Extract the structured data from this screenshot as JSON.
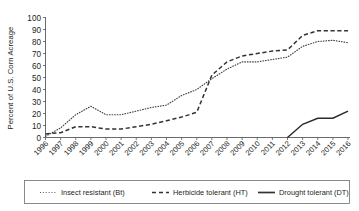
{
  "chart_data": {
    "type": "line",
    "title": "",
    "xlabel": "",
    "ylabel": "Percent of U.S. Corn Acreage",
    "ylim": [
      0,
      100
    ],
    "ytick_values": [
      0,
      10,
      20,
      30,
      40,
      50,
      60,
      70,
      80,
      90,
      100
    ],
    "grid": false,
    "legend_position": "bottom",
    "categories": [
      "1996",
      "1997",
      "1998",
      "1999",
      "2000",
      "2001",
      "2002",
      "2003",
      "2004",
      "2005",
      "2006",
      "2007",
      "2008",
      "2009",
      "2010",
      "2011",
      "2012",
      "2013",
      "2014",
      "2015",
      "2016"
    ],
    "series": [
      {
        "name": "Insect resistant (Bt)",
        "key": "bt",
        "style": "dotted",
        "color": "#404040",
        "values": [
          1,
          8,
          19,
          26,
          19,
          19,
          22,
          25,
          27,
          35,
          40,
          49,
          57,
          63,
          63,
          65,
          67,
          76,
          80,
          81,
          79
        ]
      },
      {
        "name": "Herbicide tolerant (HT)",
        "key": "ht",
        "style": "dashed",
        "color": "#333333",
        "values": [
          3,
          4,
          9,
          9,
          7,
          7,
          9,
          11,
          14,
          17,
          21,
          52,
          63,
          68,
          70,
          72,
          73,
          85,
          89,
          89,
          89
        ]
      },
      {
        "name": "Drought tolerant (DT)",
        "key": "dt",
        "style": "solid",
        "color": "#2b2b2b",
        "start_year": "2012",
        "values": [
          null,
          null,
          null,
          null,
          null,
          null,
          null,
          null,
          null,
          null,
          null,
          null,
          null,
          null,
          null,
          null,
          0,
          11,
          16,
          16,
          22
        ]
      }
    ]
  },
  "legend": {
    "items": [
      {
        "label": "Insect resistant (Bt)",
        "style": "dotted"
      },
      {
        "label": "Herbicide tolerant (HT)",
        "style": "dashed"
      },
      {
        "label": "Drought tolerant (DT)",
        "style": "solid"
      }
    ]
  }
}
